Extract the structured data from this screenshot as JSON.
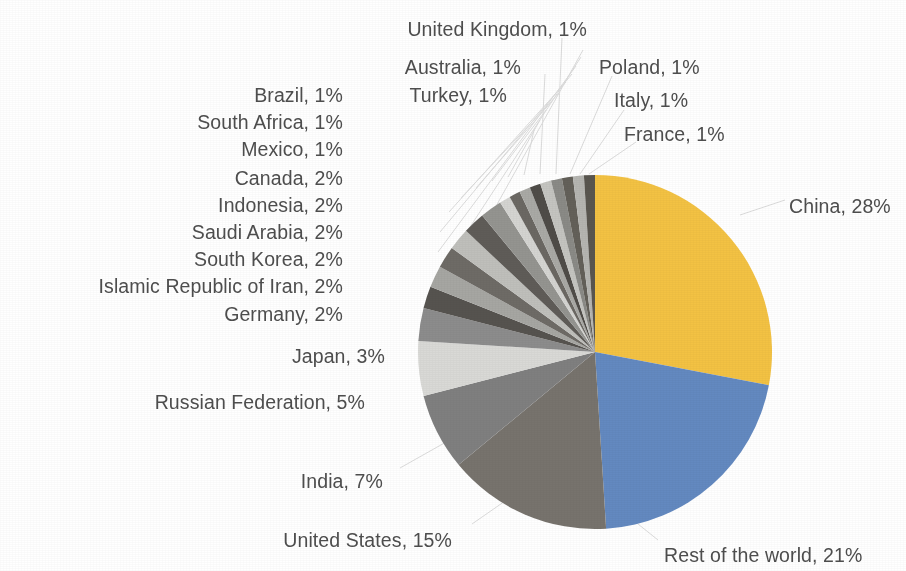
{
  "chart_data": {
    "type": "pie",
    "title": "",
    "subtitle": "",
    "xlabel": "",
    "ylabel": "",
    "legend_position": "callout-labels",
    "grid": false,
    "units": "percent",
    "total": 100,
    "start_angle_deg": 0,
    "direction": "clockwise",
    "categories": [
      "China",
      "Rest of the world",
      "United States",
      "India",
      "Russian Federation",
      "Japan",
      "Germany",
      "Islamic Republic of Iran",
      "South Korea",
      "Saudi Arabia",
      "Indonesia",
      "Canada",
      "Mexico",
      "South Africa",
      "Brazil",
      "Turkey",
      "Australia",
      "United Kingdom",
      "Poland",
      "Italy",
      "France"
    ],
    "values": [
      28,
      21,
      15,
      7,
      5,
      3,
      2,
      2,
      2,
      2,
      2,
      2,
      1,
      1,
      1,
      1,
      1,
      1,
      1,
      1,
      1
    ],
    "colors": [
      "#f3c243",
      "#6389c0",
      "#77736d",
      "#7f7f7f",
      "#d9d9d6",
      "#8c8c8c",
      "#56534f",
      "#a6a6a2",
      "#6e6b66",
      "#bfbfbb",
      "#5f5c58",
      "#949490",
      "#d4d4d1",
      "#6b6863",
      "#a9a9a5",
      "#4f4c48",
      "#c4c4c0",
      "#8a8a86",
      "#636059",
      "#b5b5b1",
      "#59564f"
    ],
    "slices": [
      {
        "label": "China, 28%",
        "name": "China",
        "value": 28,
        "color": "#f3c243"
      },
      {
        "label": "Rest of the world, 21%",
        "name": "Rest of the world",
        "value": 21,
        "color": "#6389c0"
      },
      {
        "label": "United States, 15%",
        "name": "United States",
        "value": 15,
        "color": "#77736d"
      },
      {
        "label": "India, 7%",
        "name": "India",
        "value": 7,
        "color": "#7f7f7f"
      },
      {
        "label": "Russian Federation, 5%",
        "name": "Russian Federation",
        "value": 5,
        "color": "#d9d9d6"
      },
      {
        "label": "Japan, 3%",
        "name": "Japan",
        "value": 3,
        "color": "#8c8c8c"
      },
      {
        "label": "Germany, 2%",
        "name": "Germany",
        "value": 2,
        "color": "#56534f"
      },
      {
        "label": "Islamic Republic of Iran, 2%",
        "name": "Islamic Republic of Iran",
        "value": 2,
        "color": "#a6a6a2"
      },
      {
        "label": "South Korea, 2%",
        "name": "South Korea",
        "value": 2,
        "color": "#6e6b66"
      },
      {
        "label": "Saudi Arabia, 2%",
        "name": "Saudi Arabia",
        "value": 2,
        "color": "#bfbfbb"
      },
      {
        "label": "Indonesia, 2%",
        "name": "Indonesia",
        "value": 2,
        "color": "#5f5c58"
      },
      {
        "label": "Canada, 2%",
        "name": "Canada",
        "value": 2,
        "color": "#949490"
      },
      {
        "label": "Mexico, 1%",
        "name": "Mexico",
        "value": 1,
        "color": "#d4d4d1"
      },
      {
        "label": "South Africa, 1%",
        "name": "South Africa",
        "value": 1,
        "color": "#6b6863"
      },
      {
        "label": "Brazil, 1%",
        "name": "Brazil",
        "value": 1,
        "color": "#a9a9a5"
      },
      {
        "label": "Turkey, 1%",
        "name": "Turkey",
        "value": 1,
        "color": "#4f4c48"
      },
      {
        "label": "Australia, 1%",
        "name": "Australia",
        "value": 1,
        "color": "#c4c4c0"
      },
      {
        "label": "United Kingdom, 1%",
        "name": "United Kingdom",
        "value": 1,
        "color": "#8a8a86"
      },
      {
        "label": "Poland, 1%",
        "name": "Poland",
        "value": 1,
        "color": "#636059"
      },
      {
        "label": "Italy, 1%",
        "name": "Italy",
        "value": 1,
        "color": "#b5b5b1"
      },
      {
        "label": "France, 1%",
        "name": "France",
        "value": 1,
        "color": "#59564f"
      }
    ],
    "geometry": {
      "cx": 595,
      "cy": 352,
      "r": 177,
      "canvas_width": 906,
      "canvas_height": 571
    },
    "label_positions": [
      {
        "name": "China",
        "x": 789,
        "y": 196,
        "align": "left"
      },
      {
        "name": "Rest of the world",
        "x": 664,
        "y": 545,
        "align": "left"
      },
      {
        "name": "United States",
        "x": 452,
        "y": 530,
        "align": "right"
      },
      {
        "name": "India",
        "x": 383,
        "y": 471,
        "align": "right"
      },
      {
        "name": "Russian Federation",
        "x": 365,
        "y": 392,
        "align": "right"
      },
      {
        "name": "Japan",
        "x": 385,
        "y": 346,
        "align": "right"
      },
      {
        "name": "Germany",
        "x": 343,
        "y": 304,
        "align": "right"
      },
      {
        "name": "Islamic Republic of Iran",
        "x": 343,
        "y": 276,
        "align": "right"
      },
      {
        "name": "South Korea",
        "x": 343,
        "y": 249,
        "align": "right"
      },
      {
        "name": "Saudi Arabia",
        "x": 343,
        "y": 222,
        "align": "right"
      },
      {
        "name": "Indonesia",
        "x": 343,
        "y": 195,
        "align": "right"
      },
      {
        "name": "Canada",
        "x": 343,
        "y": 168,
        "align": "right"
      },
      {
        "name": "Mexico",
        "x": 343,
        "y": 139,
        "align": "right"
      },
      {
        "name": "South Africa",
        "x": 343,
        "y": 112,
        "align": "right"
      },
      {
        "name": "Brazil",
        "x": 343,
        "y": 85,
        "align": "right"
      },
      {
        "name": "Turkey",
        "x": 507,
        "y": 85,
        "align": "right"
      },
      {
        "name": "Australia",
        "x": 521,
        "y": 57,
        "align": "right"
      },
      {
        "name": "United Kingdom",
        "x": 587,
        "y": 19,
        "align": "right"
      },
      {
        "name": "Poland",
        "x": 599,
        "y": 57,
        "align": "left"
      },
      {
        "name": "Italy",
        "x": 614,
        "y": 90,
        "align": "left"
      },
      {
        "name": "France",
        "x": 624,
        "y": 124,
        "align": "left"
      }
    ],
    "leader_lines": [
      {
        "name": "Germany",
        "x1": 583,
        "y1": 50,
        "x2": 446,
        "y2": 296
      },
      {
        "name": "Islamic Republic of Iran",
        "x1": 581,
        "y1": 57,
        "x2": 440,
        "y2": 273
      },
      {
        "name": "South Korea",
        "x1": 576,
        "y1": 66,
        "x2": 438,
        "y2": 252
      },
      {
        "name": "Saudi Arabia",
        "x1": 572,
        "y1": 74,
        "x2": 440,
        "y2": 232
      },
      {
        "name": "Indonesia",
        "x1": 566,
        "y1": 82,
        "x2": 449,
        "y2": 212
      },
      {
        "name": "Canada",
        "x1": 560,
        "y1": 92,
        "x2": 461,
        "y2": 198
      },
      {
        "name": "Mexico",
        "x1": 553,
        "y1": 100,
        "x2": 476,
        "y2": 188
      },
      {
        "name": "South Africa",
        "x1": 546,
        "y1": 110,
        "x2": 492,
        "y2": 181
      },
      {
        "name": "Brazil",
        "x1": 540,
        "y1": 120,
        "x2": 508,
        "y2": 177
      },
      {
        "name": "Turkey",
        "x1": 534,
        "y1": 130,
        "x2": 524,
        "y2": 175
      },
      {
        "name": "Australia",
        "x1": 545,
        "y1": 74,
        "x2": 540,
        "y2": 174
      },
      {
        "name": "United Kingdom",
        "x1": 562,
        "y1": 38,
        "x2": 556,
        "y2": 174
      },
      {
        "name": "Poland",
        "x1": 612,
        "y1": 76,
        "x2": 570,
        "y2": 174
      },
      {
        "name": "Italy",
        "x1": 624,
        "y1": 110,
        "x2": 580,
        "y2": 174
      },
      {
        "name": "France",
        "x1": 636,
        "y1": 142,
        "x2": 589,
        "y2": 174
      },
      {
        "name": "Japan",
        "x1": 498,
        "y1": 344,
        "x2": 452,
        "y2": 330
      },
      {
        "name": "Russian Federation",
        "x1": 557,
        "y1": 391,
        "x2": 432,
        "y2": 365
      },
      {
        "name": "India",
        "x1": 400,
        "y1": 468,
        "x2": 455,
        "y2": 437
      },
      {
        "name": "United States",
        "x1": 472,
        "y1": 524,
        "x2": 508,
        "y2": 499
      },
      {
        "name": "Rest of the world",
        "x1": 658,
        "y1": 540,
        "x2": 628,
        "y2": 516
      },
      {
        "name": "China",
        "x1": 785,
        "y1": 200,
        "x2": 740,
        "y2": 215
      }
    ]
  },
  "page": {
    "background_color": "#ffffff",
    "text_color": "#4e4e4e",
    "leader_line_color": "#dcdcdc"
  }
}
